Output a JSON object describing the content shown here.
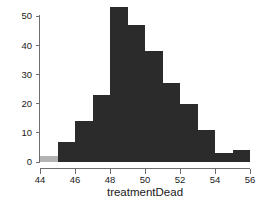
{
  "chart_data": {
    "type": "bar",
    "chart_subtype": "histogram",
    "title": "",
    "xlabel": "treatmentDead",
    "ylabel": "",
    "xlim": [
      44,
      56
    ],
    "ylim": [
      0,
      53
    ],
    "grid": false,
    "legend": null,
    "bin_width": 1,
    "bin_starts": [
      44,
      45,
      46,
      47,
      48,
      49,
      50,
      51,
      52,
      53,
      54,
      55
    ],
    "categories": [
      "44-45",
      "45-46",
      "46-47",
      "47-48",
      "48-49",
      "49-50",
      "50-51",
      "51-52",
      "52-53",
      "53-54",
      "54-55",
      "55-56"
    ],
    "values": [
      2,
      7,
      14,
      23,
      53,
      47,
      38,
      27,
      20,
      11,
      3,
      4
    ],
    "bar_colors": [
      "#b3b3b3",
      "#2b2b2b",
      "#2b2b2b",
      "#2b2b2b",
      "#2b2b2b",
      "#2b2b2b",
      "#2b2b2b",
      "#2b2b2b",
      "#2b2b2b",
      "#2b2b2b",
      "#2b2b2b",
      "#2b2b2b"
    ],
    "x_ticks": [
      44,
      46,
      48,
      50,
      52,
      54,
      56
    ],
    "x_tick_labels": [
      "44",
      "46",
      "48",
      "50",
      "52",
      "54",
      "56"
    ],
    "y_ticks": [
      0,
      10,
      20,
      30,
      40,
      50
    ],
    "y_tick_labels": [
      "0",
      "10",
      "20",
      "30",
      "40",
      "50"
    ],
    "highlight_color": "#b3b3b3",
    "bar_color": "#2b2b2b",
    "axis_color": "#6e6e6e",
    "text_color": "#1a1a1a",
    "background": "#ffffff"
  },
  "axes": {
    "x_title": "treatmentDead"
  }
}
